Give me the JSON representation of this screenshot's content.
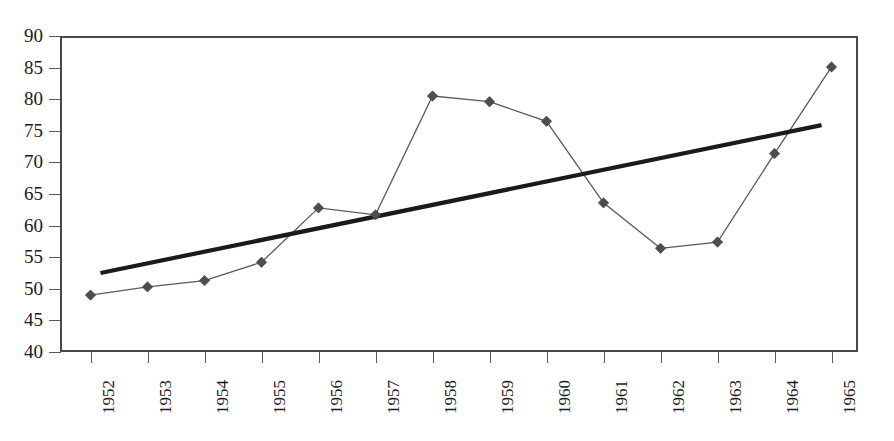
{
  "chart_data": {
    "type": "line",
    "title": "",
    "subtitle": "",
    "xlabel": "",
    "ylabel": "",
    "categories": [
      "1952",
      "1953",
      "1954",
      "1955",
      "1956",
      "1957",
      "1958",
      "1959",
      "1960",
      "1961",
      "1962",
      "1963",
      "1964",
      "1965"
    ],
    "ylim": [
      40,
      90
    ],
    "yticks": [
      40,
      45,
      50,
      55,
      60,
      65,
      70,
      75,
      80,
      85,
      90
    ],
    "grid": true,
    "legend": "none",
    "series": [
      {
        "name": "data",
        "marker": "diamond",
        "color": "#4d4d4d",
        "values": [
          49.0,
          50.3,
          51.3,
          54.2,
          62.8,
          61.7,
          80.5,
          79.6,
          76.5,
          63.6,
          56.4,
          57.4,
          71.4,
          85.1
        ]
      },
      {
        "name": "linear trendline",
        "marker": "none",
        "color": "#1a1a1a",
        "endpoints": [
          52.5,
          75.9
        ]
      }
    ]
  },
  "axes": {
    "y_tick_labels": [
      "90",
      "85",
      "80",
      "75",
      "70",
      "65",
      "60",
      "55",
      "50",
      "45",
      "40"
    ],
    "x_tick_labels": [
      "1952",
      "1953",
      "1954",
      "1955",
      "1956",
      "1957",
      "1958",
      "1959",
      "1960",
      "1961",
      "1962",
      "1963",
      "1964",
      "1965"
    ]
  }
}
